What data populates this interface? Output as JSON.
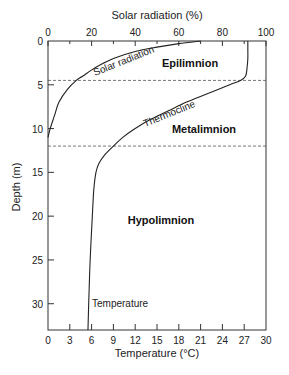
{
  "chart_data": {
    "type": "line",
    "title": "",
    "top_axis": {
      "label": "Solar radiation (%)",
      "ticks": [
        0,
        20,
        40,
        60,
        80,
        100
      ],
      "range": [
        0,
        100
      ]
    },
    "bottom_axis": {
      "label": "Temperature (°C)",
      "ticks": [
        0,
        3,
        6,
        9,
        12,
        15,
        18,
        21,
        24,
        27,
        30
      ],
      "range": [
        0,
        30
      ]
    },
    "y_axis": {
      "label": "Depth (m)",
      "ticks": [
        0,
        5,
        10,
        15,
        20,
        25,
        30
      ],
      "range": [
        0,
        33
      ],
      "inverted": true
    },
    "grid": false,
    "series": [
      {
        "name": "Solar radiation",
        "axis": "top",
        "depth": [
          0,
          0.3,
          0.7,
          1.2,
          2,
          3,
          4,
          4.5,
          5.5,
          7,
          8.5,
          10,
          11
        ],
        "values": [
          70,
          60,
          50,
          40,
          30,
          22,
          16,
          13,
          9,
          5,
          3,
          1,
          0
        ]
      },
      {
        "name": "Temperature",
        "axis": "bottom",
        "depth": [
          0,
          1,
          2,
          3,
          4,
          4.5,
          5,
          6,
          7,
          8,
          9,
          10,
          11,
          12,
          13,
          14,
          15,
          17,
          20,
          25,
          30,
          33
        ],
        "values": [
          27.5,
          27.5,
          27.5,
          27.4,
          27.2,
          26.5,
          25,
          22,
          19,
          16.5,
          14,
          12,
          10.3,
          9,
          7.8,
          7,
          6.6,
          6.3,
          6.1,
          5.8,
          5.6,
          5.5
        ]
      }
    ],
    "reference_lines": [
      {
        "depth": 4.5,
        "style": "dashed"
      },
      {
        "depth": 12,
        "style": "dashed"
      }
    ],
    "annotations": [
      {
        "text": "Epilimnion",
        "depth": 2.5,
        "temperature": 19.5
      },
      {
        "text": "Metalimnion",
        "depth": 9.8,
        "temperature": 21
      },
      {
        "text": "Hypolimnion",
        "depth": 20.3,
        "temperature": 15.5
      },
      {
        "text": "Thermocline",
        "along": "Temperature",
        "depth": 9
      },
      {
        "text": "Solar radiation",
        "along": "Solar radiation",
        "depth": 2.5
      },
      {
        "text": "Temperature",
        "depth": 30,
        "temperature": 6.5
      }
    ]
  }
}
